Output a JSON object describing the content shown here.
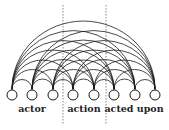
{
  "diagram": {
    "type": "arc-diagram",
    "node_count": 8,
    "nodes_x": [
      12,
      32,
      53,
      73,
      94,
      114,
      135,
      155
    ],
    "node_y": 95,
    "node_radius": 5,
    "arc_base_y": 89,
    "dividers_x": [
      63,
      106
    ],
    "groups": [
      {
        "label": "actor",
        "x": 32
      },
      {
        "label": "action",
        "x": 84
      },
      {
        "label": "acted upon",
        "x": 134
      }
    ],
    "colors": {
      "stroke": "#1a1a1a",
      "divider": "#555555",
      "background": "#ffffff"
    }
  }
}
